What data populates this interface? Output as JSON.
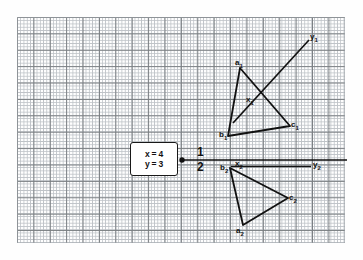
{
  "figure": {
    "kind": "graph-paper-diagram",
    "background": "graph paper, fine blue-grey grid with darker major lines every 5 squares",
    "ink_color": "#111111",
    "grid_minor_color": "#b9bec3",
    "grid_major_color": "#6f7478",
    "paper_color": "#ffffff"
  },
  "value_box": {
    "x_equation": "x = 4",
    "y_equation": "y = 3"
  },
  "branch_numbers": {
    "upper": "1",
    "lower": "2"
  },
  "labels": {
    "a1": "a",
    "a1_sub": "1",
    "b1": "b",
    "b1_sub": "1",
    "c1": "c",
    "c1_sub": "1",
    "x1": "x",
    "x1_sub": "1",
    "y1": "y",
    "y1_sub": "1",
    "a2": "a",
    "a2_sub": "2",
    "b2": "b",
    "b2_sub": "2",
    "c2": "c",
    "c2_sub": "2",
    "x2": "x",
    "x2_sub": "2",
    "y2": "y",
    "y2_sub": "2"
  },
  "geometry": {
    "axis_line": {
      "x1": 182,
      "y1": 160,
      "x2": 347,
      "y2": 160
    },
    "source_dot": {
      "cx": 182,
      "cy": 160,
      "r": 2.6
    },
    "arrow_head": {
      "tip_x": 178,
      "tip_y": 160
    },
    "triangle_1": [
      {
        "name": "a1",
        "x": 240,
        "y": 68
      },
      {
        "name": "c1",
        "x": 290,
        "y": 126
      },
      {
        "name": "b1",
        "x": 228,
        "y": 136
      }
    ],
    "triangle_2": [
      {
        "name": "b2",
        "x": 230,
        "y": 168
      },
      {
        "name": "c2",
        "x": 288,
        "y": 198
      },
      {
        "name": "a2",
        "x": 243,
        "y": 225
      }
    ],
    "ray_1": {
      "x1": 234,
      "y1": 122,
      "x2": 310,
      "y2": 40
    },
    "segment_2": {
      "x1": 232,
      "y1": 166,
      "x2": 311,
      "y2": 166
    }
  }
}
